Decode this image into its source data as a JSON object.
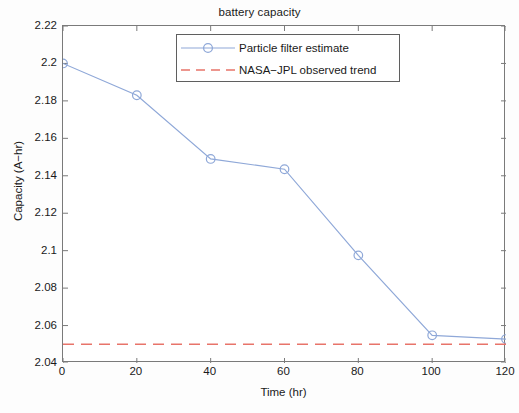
{
  "chart_data": {
    "type": "line",
    "title": "battery capacity",
    "xlabel": "Time (hr)",
    "ylabel": "Capacity (A−hr)",
    "xlim": [
      0,
      120
    ],
    "ylim": [
      2.04,
      2.22
    ],
    "grid": false,
    "legend_position": "top-center",
    "xticks": [
      0,
      20,
      40,
      60,
      80,
      100,
      120
    ],
    "xtick_labels": [
      "0",
      "20",
      "40",
      "60",
      "80",
      "100",
      "120"
    ],
    "yticks": [
      2.04,
      2.06,
      2.08,
      2.1,
      2.12,
      2.14,
      2.16,
      2.18,
      2.2,
      2.22
    ],
    "ytick_labels": [
      "2.04",
      "2.06",
      "2.08",
      "2.1",
      "2.12",
      "2.14",
      "2.16",
      "2.18",
      "2.2",
      "2.22"
    ],
    "x": [
      0,
      20,
      40,
      60,
      80,
      100,
      120
    ],
    "series": [
      {
        "name": "Particle filter estimate",
        "style": "solid-line-with-circle-markers",
        "color": "#8fa8d8",
        "values": [
          2.2,
          2.183,
          2.149,
          2.1435,
          2.0975,
          2.0548,
          2.0528
        ]
      },
      {
        "name": "NASA−JPL observed trend",
        "style": "dashed-line",
        "color": "#e8746a",
        "constant_value": 2.05,
        "values": [
          2.05,
          2.05,
          2.05,
          2.05,
          2.05,
          2.05,
          2.05
        ]
      }
    ]
  },
  "legend": {
    "entries": [
      {
        "label": "Particle filter estimate"
      },
      {
        "label": "NASA−JPL observed trend"
      }
    ]
  }
}
